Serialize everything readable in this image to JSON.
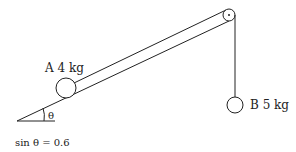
{
  "diagram": {
    "type": "incline-pulley-system",
    "block_a": {
      "label": "A 4 kg",
      "name": "A",
      "mass": "4 kg"
    },
    "block_b": {
      "label": "B 5 kg",
      "name": "B",
      "mass": "5 kg"
    },
    "angle_symbol": "θ",
    "given": "sin θ = 0.6",
    "colors": {
      "line": "#222222",
      "background": "#ffffff"
    }
  }
}
